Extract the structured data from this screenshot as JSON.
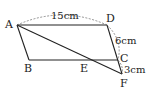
{
  "diagram": {
    "type": "geometry",
    "points": {
      "A": {
        "label": "A",
        "x": 17,
        "y": 25
      },
      "B": {
        "label": "B",
        "x": 29,
        "y": 60
      },
      "C": {
        "label": "C",
        "x": 118,
        "y": 60
      },
      "D": {
        "label": "D",
        "x": 107,
        "y": 25
      },
      "E": {
        "label": "E",
        "x": 88,
        "y": 60
      },
      "F": {
        "label": "F",
        "x": 122,
        "y": 74
      }
    },
    "measures": {
      "AD": "15cm",
      "DC": "6cm",
      "CF": "3cm"
    },
    "segments": [
      "AD",
      "DC",
      "CB",
      "BA",
      "AF",
      "CF"
    ]
  }
}
